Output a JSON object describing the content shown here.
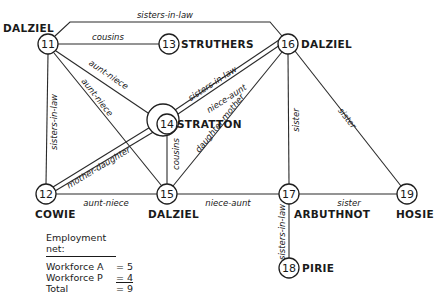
{
  "diagram": {
    "nodes": [
      {
        "id": "11",
        "name": "DALZIEL",
        "x": 48,
        "y": 44,
        "name_x": 2,
        "name_y": 31
      },
      {
        "id": "13",
        "name": "STRUTHERS",
        "x": 169,
        "y": 44,
        "name_x": 180,
        "name_y": 48
      },
      {
        "id": "16",
        "name": "DALZIEL",
        "x": 288,
        "y": 44,
        "name_x": 300,
        "name_y": 48
      },
      {
        "id": "14",
        "name": "STRATTON",
        "x": 165,
        "y": 124,
        "name_x": 176,
        "name_y": 128
      },
      {
        "id": "12",
        "name": "COWIE",
        "x": 46,
        "y": 194,
        "name_x": 36,
        "name_y": 217
      },
      {
        "id": "15",
        "name": "DALZIEL",
        "x": 167,
        "y": 194,
        "name_x": 148,
        "name_y": 217
      },
      {
        "id": "17",
        "name": "ARBUTHNOT",
        "x": 289,
        "y": 194,
        "name_x": 294,
        "name_y": 217
      },
      {
        "id": "19",
        "name": "HOSIE",
        "x": 407,
        "y": 194,
        "name_x": 397,
        "name_y": 217
      },
      {
        "id": "18",
        "name": "PIRIE",
        "x": 289,
        "y": 268,
        "name_x": 302,
        "name_y": 272
      }
    ],
    "edges": [
      {
        "from": "11",
        "to": "16",
        "label": "sisters-in-law"
      },
      {
        "from": "11",
        "to": "13",
        "label": "cousins"
      },
      {
        "from": "11",
        "to": "14",
        "label": "aunt-niece"
      },
      {
        "from": "11",
        "to": "15",
        "label": "aunt-niece"
      },
      {
        "from": "11",
        "to": "12",
        "label": "sisters-in-law"
      },
      {
        "from": "14",
        "to": "16",
        "label": "sisters-in-law"
      },
      {
        "from": "14",
        "to": "16",
        "label": "niece-aunt"
      },
      {
        "from": "12",
        "to": "16",
        "label": "mother-daughter"
      },
      {
        "from": "14",
        "to": "15",
        "label": "cousins"
      },
      {
        "from": "15",
        "to": "16",
        "label": "daughter-mother"
      },
      {
        "from": "16",
        "to": "17",
        "label": "sister"
      },
      {
        "from": "16",
        "to": "19",
        "label": "sister"
      },
      {
        "from": "12",
        "to": "15",
        "label": "aunt-niece"
      },
      {
        "from": "15",
        "to": "17",
        "label": "niece-aunt"
      },
      {
        "from": "17",
        "to": "19",
        "label": "sister"
      },
      {
        "from": "17",
        "to": "18",
        "label": "sisters-in-law"
      }
    ]
  },
  "labels": {
    "n11": "11",
    "n13": "13",
    "n16": "16",
    "n14": "14",
    "n12": "12",
    "n15": "15",
    "n17": "17",
    "n19": "19",
    "n18": "18",
    "name11": "DALZIEL",
    "name13": "STRUTHERS",
    "name16": "DALZIEL",
    "name14": "STRATTON",
    "name12": "COWIE",
    "name15": "DALZIEL",
    "name17": "ARBUTHNOT",
    "name19": "HOSIE",
    "name18": "PIRIE",
    "e_11_16": "sisters-in-law",
    "e_11_13": "cousins",
    "e_11_14": "aunt-niece",
    "e_11_15": "aunt-niece",
    "e_11_12": "sisters-in-law",
    "e_14_16a": "sisters-in-law",
    "e_14_16b": "niece-aunt",
    "e_12_16": "mother-daughter",
    "e_14_15": "cousins",
    "e_15_16": "daughter-mother",
    "e_16_17": "sister",
    "e_16_19": "sister",
    "e_12_15": "aunt-niece",
    "e_15_17": "niece-aunt",
    "e_17_19": "sister",
    "e_17_18": "sisters-in-law"
  },
  "legend": {
    "title": "Employment net:",
    "rows": [
      {
        "label": "Workforce A",
        "value": "= 5"
      },
      {
        "label": "Workforce P",
        "value": "= 4"
      },
      {
        "label": "Total",
        "value": "= 9"
      }
    ]
  }
}
